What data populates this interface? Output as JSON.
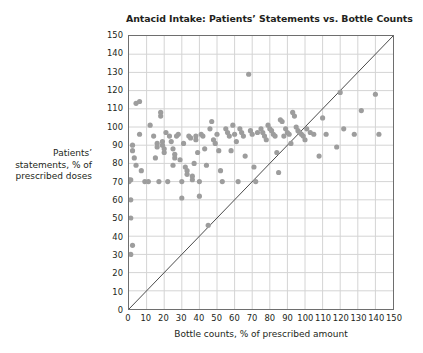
{
  "chart_data": {
    "type": "scatter",
    "title": "Antacid Intake: Patients’ Statements vs. Bottle Counts",
    "xlabel": "Bottle counts, % of prescribed amount",
    "ylabel_lines": [
      "Patients’",
      "statements, % of",
      "prescribed doses"
    ],
    "ylabel": "Patients’ statements, % of prescribed doses",
    "xlim": [
      0,
      150
    ],
    "ylim": [
      0,
      150
    ],
    "xticks": [
      0,
      10,
      20,
      30,
      40,
      50,
      60,
      70,
      80,
      90,
      100,
      110,
      120,
      130,
      140,
      150
    ],
    "yticks": [
      0,
      10,
      20,
      30,
      40,
      50,
      60,
      70,
      80,
      90,
      100,
      110,
      120,
      130,
      140,
      150
    ],
    "grid": true,
    "legend": "none",
    "marker": {
      "shape": "circle",
      "color": "#9d9d9d",
      "size_px": 5.2
    },
    "reference_line": {
      "name": "identity-line",
      "equation": "y = x",
      "from": [
        0,
        0
      ],
      "to": [
        150,
        150
      ],
      "color": "#4a4a4a",
      "width_px": 1
    },
    "series": [
      {
        "name": "patients",
        "color": "#9d9d9d",
        "points": [
          [
            0,
            71
          ],
          [
            1,
            71
          ],
          [
            0,
            70
          ],
          [
            2,
            90
          ],
          [
            2,
            87
          ],
          [
            1,
            60
          ],
          [
            1,
            50
          ],
          [
            2,
            35
          ],
          [
            1,
            30
          ],
          [
            4,
            113
          ],
          [
            6,
            114
          ],
          [
            3,
            83
          ],
          [
            4,
            79
          ],
          [
            6,
            96
          ],
          [
            7,
            76
          ],
          [
            9,
            70
          ],
          [
            11,
            70
          ],
          [
            12,
            101
          ],
          [
            14,
            95
          ],
          [
            15,
            83
          ],
          [
            16,
            91
          ],
          [
            16,
            89
          ],
          [
            17,
            70
          ],
          [
            18,
            108
          ],
          [
            18,
            106
          ],
          [
            19,
            92
          ],
          [
            19,
            90
          ],
          [
            20,
            88
          ],
          [
            20,
            86
          ],
          [
            21,
            97
          ],
          [
            22,
            70
          ],
          [
            23,
            95
          ],
          [
            24,
            92
          ],
          [
            25,
            88
          ],
          [
            25,
            79
          ],
          [
            26,
            85
          ],
          [
            26,
            83
          ],
          [
            27,
            95
          ],
          [
            28,
            96
          ],
          [
            29,
            82
          ],
          [
            30,
            70
          ],
          [
            30,
            61
          ],
          [
            31,
            91
          ],
          [
            32,
            78
          ],
          [
            33,
            76
          ],
          [
            33,
            74
          ],
          [
            34,
            95
          ],
          [
            35,
            94
          ],
          [
            36,
            73
          ],
          [
            36,
            71
          ],
          [
            37,
            80
          ],
          [
            38,
            95
          ],
          [
            38,
            93
          ],
          [
            39,
            86
          ],
          [
            40,
            70
          ],
          [
            40,
            62
          ],
          [
            41,
            96
          ],
          [
            42,
            95
          ],
          [
            43,
            88
          ],
          [
            44,
            79
          ],
          [
            45,
            46
          ],
          [
            46,
            99
          ],
          [
            47,
            103
          ],
          [
            48,
            93
          ],
          [
            49,
            91
          ],
          [
            50,
            96
          ],
          [
            51,
            87
          ],
          [
            52,
            76
          ],
          [
            53,
            70
          ],
          [
            55,
            99
          ],
          [
            56,
            97
          ],
          [
            57,
            95
          ],
          [
            58,
            87
          ],
          [
            59,
            101
          ],
          [
            60,
            96
          ],
          [
            61,
            92
          ],
          [
            62,
            70
          ],
          [
            63,
            99
          ],
          [
            64,
            97
          ],
          [
            65,
            95
          ],
          [
            66,
            84
          ],
          [
            68,
            129
          ],
          [
            69,
            98
          ],
          [
            70,
            96
          ],
          [
            71,
            78
          ],
          [
            72,
            70
          ],
          [
            73,
            97
          ],
          [
            75,
            99
          ],
          [
            76,
            97
          ],
          [
            77,
            95
          ],
          [
            78,
            93
          ],
          [
            79,
            101
          ],
          [
            80,
            99
          ],
          [
            81,
            98
          ],
          [
            82,
            96
          ],
          [
            83,
            95
          ],
          [
            84,
            86
          ],
          [
            85,
            75
          ],
          [
            86,
            104
          ],
          [
            87,
            103
          ],
          [
            88,
            95
          ],
          [
            89,
            99
          ],
          [
            90,
            97
          ],
          [
            91,
            96
          ],
          [
            92,
            91
          ],
          [
            93,
            108
          ],
          [
            94,
            106
          ],
          [
            95,
            100
          ],
          [
            96,
            98
          ],
          [
            97,
            97
          ],
          [
            98,
            96
          ],
          [
            99,
            95
          ],
          [
            100,
            93
          ],
          [
            101,
            99
          ],
          [
            103,
            97
          ],
          [
            105,
            96
          ],
          [
            108,
            84
          ],
          [
            110,
            105
          ],
          [
            112,
            96
          ],
          [
            118,
            89
          ],
          [
            120,
            119
          ],
          [
            122,
            99
          ],
          [
            128,
            96
          ],
          [
            132,
            109
          ],
          [
            140,
            118
          ],
          [
            142,
            96
          ]
        ]
      }
    ]
  }
}
